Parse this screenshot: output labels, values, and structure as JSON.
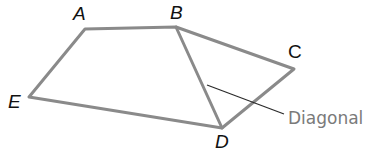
{
  "diagram": {
    "type": "pentagon-with-diagonal",
    "colors": {
      "edge": "#8a8a8a",
      "leader": "#2a2a2a",
      "label": "#111111",
      "annotation": "#7a7a7a"
    },
    "vertices": [
      {
        "name": "A",
        "x": 85,
        "y": 29,
        "label_x": 73,
        "label_y": 20
      },
      {
        "name": "B",
        "x": 176,
        "y": 27,
        "label_x": 170,
        "label_y": 19
      },
      {
        "name": "C",
        "x": 294,
        "y": 69,
        "label_x": 288,
        "label_y": 58
      },
      {
        "name": "D",
        "x": 222,
        "y": 128,
        "label_x": 215,
        "label_y": 148
      },
      {
        "name": "E",
        "x": 29,
        "y": 97,
        "label_x": 8,
        "label_y": 108
      }
    ],
    "edges": [
      [
        "A",
        "B"
      ],
      [
        "B",
        "C"
      ],
      [
        "C",
        "D"
      ],
      [
        "D",
        "E"
      ],
      [
        "E",
        "A"
      ]
    ],
    "diagonal": [
      "B",
      "D"
    ],
    "annotation": {
      "text": "Diagonal",
      "x": 288,
      "y": 124,
      "leader_from": [
        207,
        85
      ],
      "leader_to": [
        284,
        114
      ]
    }
  }
}
